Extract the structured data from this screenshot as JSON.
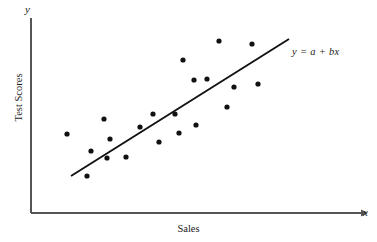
{
  "chart_data": {
    "type": "scatter",
    "title": "",
    "xlabel": "Sales",
    "ylabel": "Test Scores",
    "x_axis_tip": "x",
    "y_axis_tip": "y",
    "grid": false,
    "legend": "none",
    "axis_color": "#555555",
    "point_color": "#111111",
    "line_color": "#111111",
    "point_radius_px": 2.6,
    "xlim": [
      0,
      100
    ],
    "ylim": [
      0,
      100
    ],
    "annotations": [
      {
        "name": "regression-equation",
        "text": "y = a + bx",
        "x_px": 292,
        "y_px": 46
      }
    ],
    "fit_line": {
      "label": "y = a + bx",
      "x_start_px": 71,
      "y_start_px": 176,
      "x_end_px": 289,
      "y_end_px": 39
    },
    "points_px": [
      {
        "x": 67,
        "y": 134
      },
      {
        "x": 87,
        "y": 176
      },
      {
        "x": 91,
        "y": 151
      },
      {
        "x": 104,
        "y": 119
      },
      {
        "x": 107,
        "y": 158
      },
      {
        "x": 110,
        "y": 139
      },
      {
        "x": 126,
        "y": 157
      },
      {
        "x": 140,
        "y": 127
      },
      {
        "x": 153,
        "y": 114
      },
      {
        "x": 159,
        "y": 142
      },
      {
        "x": 175,
        "y": 114
      },
      {
        "x": 179,
        "y": 133
      },
      {
        "x": 183,
        "y": 60
      },
      {
        "x": 194,
        "y": 80
      },
      {
        "x": 196,
        "y": 125
      },
      {
        "x": 207,
        "y": 79
      },
      {
        "x": 219,
        "y": 41
      },
      {
        "x": 227,
        "y": 107
      },
      {
        "x": 234,
        "y": 87
      },
      {
        "x": 252,
        "y": 44
      },
      {
        "x": 258,
        "y": 84
      }
    ],
    "points_data": [
      {
        "x": 12,
        "y": 45
      },
      {
        "x": 19,
        "y": 20
      },
      {
        "x": 20,
        "y": 35
      },
      {
        "x": 25,
        "y": 54
      },
      {
        "x": 26,
        "y": 31
      },
      {
        "x": 27,
        "y": 42
      },
      {
        "x": 32,
        "y": 31
      },
      {
        "x": 37,
        "y": 49
      },
      {
        "x": 42,
        "y": 57
      },
      {
        "x": 44,
        "y": 40
      },
      {
        "x": 49,
        "y": 57
      },
      {
        "x": 51,
        "y": 46
      },
      {
        "x": 52,
        "y": 89
      },
      {
        "x": 56,
        "y": 77
      },
      {
        "x": 57,
        "y": 50
      },
      {
        "x": 61,
        "y": 78
      },
      {
        "x": 65,
        "y": 100
      },
      {
        "x": 68,
        "y": 63
      },
      {
        "x": 71,
        "y": 74
      },
      {
        "x": 78,
        "y": 98
      },
      {
        "x": 80,
        "y": 76
      }
    ]
  },
  "figure": {
    "axis_origin_px": {
      "x": 31,
      "y": 213
    },
    "y_axis_top_px": 18,
    "x_axis_right_px": 361
  }
}
